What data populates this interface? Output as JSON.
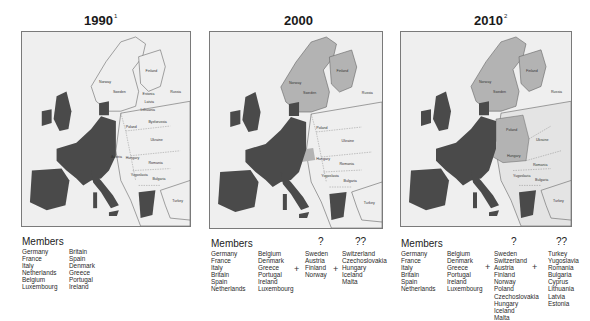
{
  "colors": {
    "member": "#4a4a4a",
    "candidate_near": "#b3b3b3",
    "candidate_far": "#e4e4e4",
    "nonmember": "#efefef",
    "frame": "#7a7a7a",
    "water": "#efefef"
  },
  "panels": [
    {
      "year": "1990",
      "footnote": "1",
      "legend": {
        "heading": "Members",
        "members_col1": [
          "Germany",
          "France",
          "Italy",
          "Netherlands",
          "Belgium",
          "Luxembourg"
        ],
        "members_col2": [
          "Britain",
          "Spain",
          "Denmark",
          "Greece",
          "Portugal",
          "Ireland"
        ]
      }
    },
    {
      "year": "2000",
      "footnote": "",
      "legend": {
        "heading": "Members",
        "members_col1": [
          "Germany",
          "France",
          "Italy",
          "Britain",
          "Spain",
          "Netherlands"
        ],
        "members_col2": [
          "Belgium",
          "Denmark",
          "Greece",
          "Portugal",
          "Ireland",
          "Luxembourg"
        ],
        "plus_1": "+",
        "group_q_label": "?",
        "group_q": [
          "Sweden",
          "Austria",
          "Finland",
          "Norway"
        ],
        "plus_2": "+",
        "group_qq_label": "??",
        "group_qq": [
          "Switzerland",
          "Czechoslovakia",
          "Hungary",
          "Iceland",
          "Malta"
        ]
      }
    },
    {
      "year": "2010",
      "footnote": "2",
      "legend": {
        "heading": "Members",
        "members_col1": [
          "Germany",
          "France",
          "Italy",
          "Britain",
          "Spain",
          "Netherlands"
        ],
        "members_col2": [
          "Belgium",
          "Denmark",
          "Greece",
          "Portugal",
          "Ireland",
          "Luxembourg"
        ],
        "plus_1": "+",
        "group_q_label": "?",
        "group_q": [
          "Sweden",
          "Switzerland",
          "Austria",
          "Finland",
          "Norway",
          "Poland",
          "Czechoslovakia",
          "Hungary",
          "Iceland",
          "Malta"
        ],
        "plus_2": "+",
        "group_qq_label": "??",
        "group_qq": [
          "Turkey",
          "Yugoslavia",
          "Romania",
          "Bulgaria",
          "Cyprus",
          "Lithuania",
          "Latvia",
          "Estonia"
        ]
      }
    }
  ],
  "map_labels": {
    "norway": "Norway",
    "sweden": "Sweden",
    "finland": "Finland",
    "russia": "Russia",
    "estonia": "Estonia",
    "latvia": "Latvia",
    "lithuania": "Lithuania",
    "denmark": "Denmark",
    "byelorussia": "Byelorussia",
    "poland": "Poland",
    "ukraine": "Ukraine",
    "germany": "Germany",
    "czechoslovakia": "Czechoslovakia",
    "austria": "Austria",
    "hungary": "Hungary",
    "romania": "Romania",
    "yugoslavia": "Yugoslavia",
    "bulgaria": "Bulgaria",
    "turkey": "Turkey",
    "france": "France",
    "spain": "Spain",
    "italy": "Italy",
    "britain": "Britain",
    "ireland": "Ireland",
    "netherlands": "Netherlands",
    "belgium": "Belgium",
    "luxembourg": "Luxembourg",
    "greece": "Greece",
    "portugal": "Portugal",
    "switzerland": "Switzerland"
  }
}
